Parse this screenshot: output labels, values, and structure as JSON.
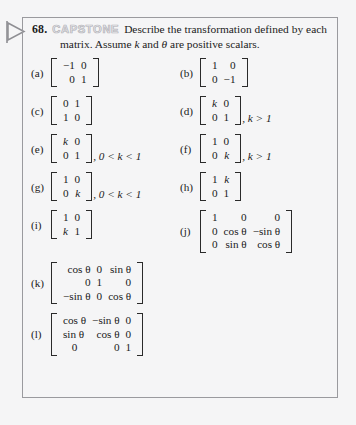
{
  "exercise": {
    "number": "68.",
    "badge": "CAPSTONE",
    "prompt": "Describe the transformation defined by each matrix. Assume",
    "prompt_var_k": "k",
    "prompt_mid": "and",
    "prompt_var_theta": "θ",
    "prompt_end": "are positive scalars.",
    "marker_icon": "flag-triangle-marker-icon"
  },
  "colors": {
    "page_background": "#f5f5f6",
    "box_border": "#9a9a9e",
    "text": "#1b1b1b",
    "badge_fill": "#e9e9ec",
    "badge_outline": "#b7b7bc"
  },
  "parts": {
    "a": {
      "label": "(a)",
      "rows": [
        [
          "−1",
          "0"
        ],
        [
          "0",
          "1"
        ]
      ],
      "suffix": ""
    },
    "b": {
      "label": "(b)",
      "rows": [
        [
          "1",
          "0"
        ],
        [
          "0",
          "−1"
        ]
      ],
      "suffix": ""
    },
    "c": {
      "label": "(c)",
      "rows": [
        [
          "0",
          "1"
        ],
        [
          "1",
          "0"
        ]
      ],
      "suffix": ""
    },
    "d": {
      "label": "(d)",
      "rows": [
        [
          "k",
          "0"
        ],
        [
          "0",
          "1"
        ]
      ],
      "suffix": ", k > 1"
    },
    "e": {
      "label": "(e)",
      "rows": [
        [
          "k",
          "0"
        ],
        [
          "0",
          "1"
        ]
      ],
      "suffix": ", 0 < k < 1"
    },
    "f": {
      "label": "(f)",
      "rows": [
        [
          "1",
          "0"
        ],
        [
          "0",
          "k"
        ]
      ],
      "suffix": ", k > 1"
    },
    "g": {
      "label": "(g)",
      "rows": [
        [
          "1",
          "0"
        ],
        [
          "0",
          "k"
        ]
      ],
      "suffix": ", 0 < k < 1"
    },
    "h": {
      "label": "(h)",
      "rows": [
        [
          "1",
          "k"
        ],
        [
          "0",
          "1"
        ]
      ],
      "suffix": ""
    },
    "i": {
      "label": "(i)",
      "rows": [
        [
          "1",
          "0"
        ],
        [
          "k",
          "1"
        ]
      ],
      "suffix": ""
    },
    "j": {
      "label": "(j)",
      "rows": [
        [
          "1",
          "0",
          "0"
        ],
        [
          "0",
          "cos θ",
          "−sin θ"
        ],
        [
          "0",
          "sin θ",
          "cos θ"
        ]
      ],
      "suffix": ""
    },
    "k": {
      "label": "(k)",
      "rows": [
        [
          "cos θ",
          "0",
          "sin θ"
        ],
        [
          "0",
          "1",
          "0"
        ],
        [
          "−sin θ",
          "0",
          "cos θ"
        ]
      ],
      "suffix": ""
    },
    "l": {
      "label": "(l)",
      "rows": [
        [
          "cos θ",
          "−sin θ",
          "0"
        ],
        [
          "sin θ",
          "cos θ",
          "0"
        ],
        [
          "0",
          "0",
          "1"
        ]
      ],
      "suffix": ""
    }
  }
}
